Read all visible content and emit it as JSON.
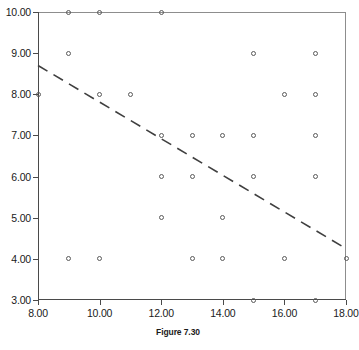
{
  "caption": "Figure 7.30",
  "colors": {
    "axis": "#4a4a4a",
    "frame": "#8d8d8d",
    "marker": "#5a5a5a",
    "trend": "#3f3f3f",
    "background": "#ffffff"
  },
  "chart_data": {
    "type": "scatter",
    "title": "Figure 7.30",
    "xlabel": "",
    "ylabel": "",
    "xlim": [
      8,
      18
    ],
    "ylim": [
      3,
      10
    ],
    "xticks": [
      8,
      10,
      12,
      14,
      16,
      18
    ],
    "yticks": [
      3,
      4,
      5,
      6,
      7,
      8,
      9,
      10
    ],
    "xtick_labels": [
      "8.00",
      "10.00",
      "12.00",
      "14.00",
      "16.00",
      "18.00"
    ],
    "ytick_labels": [
      "3.00",
      "4.00",
      "5.00",
      "6.00",
      "7.00",
      "8.00",
      "9.00",
      "10.00"
    ],
    "grid": false,
    "legend": null,
    "marker_style": "open-circle",
    "points": [
      {
        "x": 9,
        "y": 10
      },
      {
        "x": 10,
        "y": 10
      },
      {
        "x": 12,
        "y": 10
      },
      {
        "x": 9,
        "y": 9
      },
      {
        "x": 15,
        "y": 9
      },
      {
        "x": 17,
        "y": 9
      },
      {
        "x": 8,
        "y": 8
      },
      {
        "x": 10,
        "y": 8
      },
      {
        "x": 11,
        "y": 8
      },
      {
        "x": 16,
        "y": 8
      },
      {
        "x": 17,
        "y": 8
      },
      {
        "x": 12,
        "y": 7
      },
      {
        "x": 13,
        "y": 7
      },
      {
        "x": 14,
        "y": 7
      },
      {
        "x": 15,
        "y": 7
      },
      {
        "x": 17,
        "y": 7
      },
      {
        "x": 12,
        "y": 6
      },
      {
        "x": 13,
        "y": 6
      },
      {
        "x": 15,
        "y": 6
      },
      {
        "x": 17,
        "y": 6
      },
      {
        "x": 12,
        "y": 5
      },
      {
        "x": 14,
        "y": 5
      },
      {
        "x": 9,
        "y": 4
      },
      {
        "x": 10,
        "y": 4
      },
      {
        "x": 13,
        "y": 4
      },
      {
        "x": 14,
        "y": 4
      },
      {
        "x": 16,
        "y": 4
      },
      {
        "x": 18,
        "y": 4
      },
      {
        "x": 15,
        "y": 3
      },
      {
        "x": 17,
        "y": 3
      }
    ],
    "trend_line": {
      "style": "dashed",
      "x_start": 8,
      "y_start": 8.7,
      "x_end": 18,
      "y_end": 4.25
    }
  }
}
